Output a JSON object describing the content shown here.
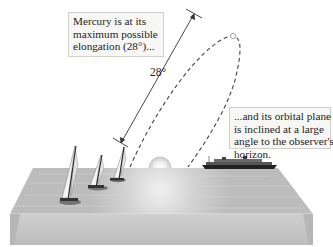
{
  "diagram": {
    "callouts": {
      "top": {
        "lines": [
          "Mercury is at its",
          "maximum possible",
          "elongation (28°)..."
        ]
      },
      "right": {
        "lines": [
          "...and its orbital plane",
          "is inclined at a large",
          "angle to the observer's",
          "horizon."
        ]
      }
    },
    "angle_label": "28°",
    "elements": {
      "sun": "sun-on-horizon",
      "mercury": "mercury-at-max-elongation",
      "orbit": "dashed-orbit-path",
      "ocean": "ocean-surface-block",
      "boats": [
        "sailboat-1",
        "sailboat-2",
        "sailboat-3"
      ],
      "ship": "ocean-liner"
    },
    "colors": {
      "ocean_top": "#bdbdbd",
      "ocean_front": "#c4c4c4",
      "lines": "#3a3a3a",
      "callout_bg": "#f7f7f5",
      "callout_border": "#cfcfcc"
    }
  }
}
